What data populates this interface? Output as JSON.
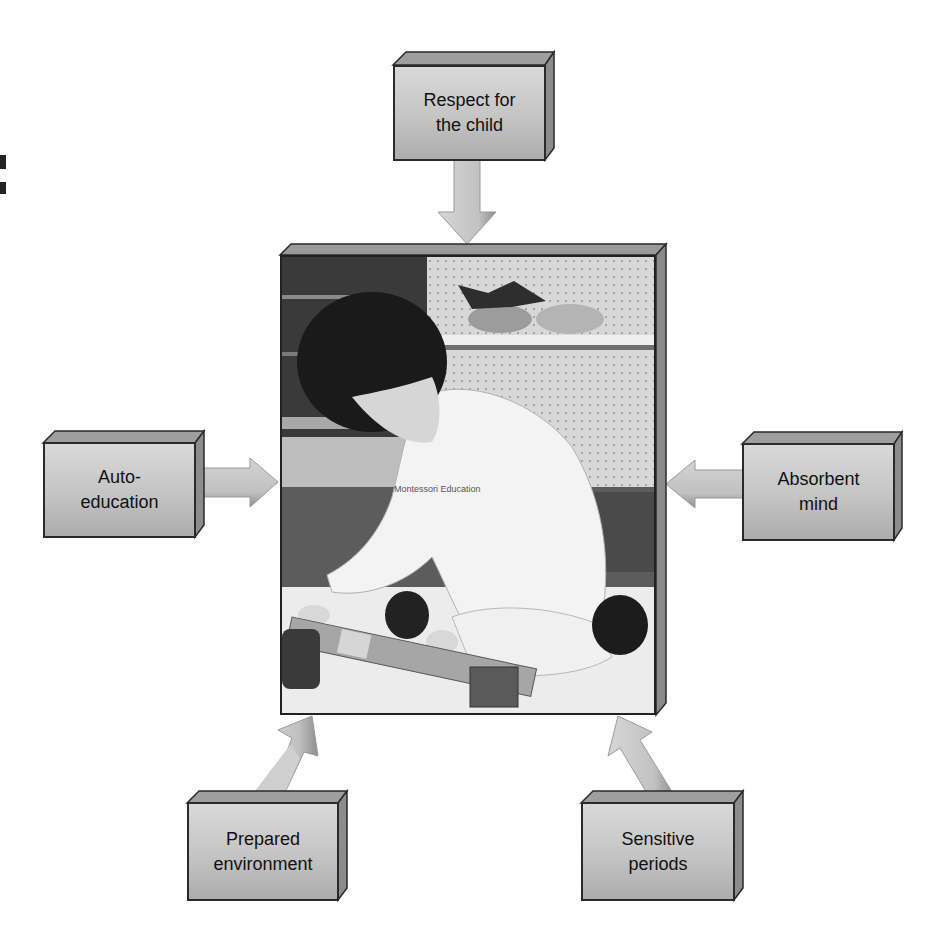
{
  "diagram": {
    "center": {
      "type": "photo",
      "description": "Child kneeling on the floor arranging wooden blocks in a classroom",
      "shirt_text": "Montessori Education"
    },
    "boxes": [
      {
        "id": "top",
        "label": "Respect for\nthe child"
      },
      {
        "id": "left",
        "label": "Auto-\neducation"
      },
      {
        "id": "right",
        "label": "Absorbent\nmind"
      },
      {
        "id": "bottom-left",
        "label": "Prepared\nenvironment"
      },
      {
        "id": "bottom-right",
        "label": "Sensitive\nperiods"
      }
    ],
    "arrow_direction": "all arrows point toward the central photo",
    "colors": {
      "box_light": "#d9d9d9",
      "box_dark": "#acacac",
      "box_border": "#2a2a2a",
      "arrow_light": "#c8c8c8",
      "arrow_shadow": "#8a8a8a"
    }
  }
}
